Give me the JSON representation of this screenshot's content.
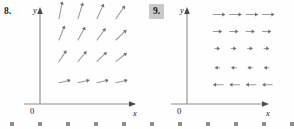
{
  "figure": {
    "caption_panels": [
      {
        "number_label": "8.",
        "highlighted": false,
        "axes": {
          "x_label": "x",
          "y_label": "y",
          "origin_label": "0"
        },
        "field_description": "Arrows point up and to the right; slope decreases with increasing x and the bottom row is horizontal.",
        "arrow_color": "#9a9a9a",
        "axis_color": "#8c8c8c"
      },
      {
        "number_label": "9.",
        "highlighted": true,
        "highlight_color": "#c9c9c9",
        "axes": {
          "x_label": "x",
          "y_label": "y",
          "origin_label": "0"
        },
        "field_description": "Horizontal arrows: pointing right in the upper rows, pointing left in the lower rows, with length shrinking toward the middle.",
        "arrow_color": "#9a9a9a",
        "axis_color": "#8c8c8c"
      }
    ],
    "bottom_markers": {
      "count": 11,
      "spacing": 28,
      "color": "#8e8e8e",
      "size": 4
    }
  },
  "chart_data": [
    {
      "type": "scatter",
      "title": "",
      "subtitle": "",
      "xlabel": "x",
      "ylabel": "y",
      "origin_label": "0",
      "grid": false,
      "legend_position": "none",
      "plot_kind": "vector-field",
      "axis_ranges": {
        "xlim": [
          0,
          5
        ],
        "ylim": [
          0,
          4.5
        ]
      },
      "annotations": [
        "8."
      ],
      "vectors": [
        {
          "x": 1,
          "y": 1,
          "dx": 0.62,
          "dy": 0.12
        },
        {
          "x": 2,
          "y": 1,
          "dx": 0.62,
          "dy": 0.12
        },
        {
          "x": 3,
          "y": 1,
          "dx": 0.62,
          "dy": 0.12
        },
        {
          "x": 4,
          "y": 1,
          "dx": 0.62,
          "dy": 0.12
        },
        {
          "x": 1,
          "y": 2,
          "dx": 0.4,
          "dy": 0.52
        },
        {
          "x": 2,
          "y": 2,
          "dx": 0.46,
          "dy": 0.48
        },
        {
          "x": 3,
          "y": 2,
          "dx": 0.52,
          "dy": 0.44
        },
        {
          "x": 4,
          "y": 2,
          "dx": 0.58,
          "dy": 0.4
        },
        {
          "x": 1,
          "y": 3,
          "dx": 0.3,
          "dy": 0.68
        },
        {
          "x": 2,
          "y": 3,
          "dx": 0.38,
          "dy": 0.62
        },
        {
          "x": 3,
          "y": 3,
          "dx": 0.46,
          "dy": 0.56
        },
        {
          "x": 4,
          "y": 3,
          "dx": 0.56,
          "dy": 0.48
        },
        {
          "x": 1,
          "y": 4,
          "dx": 0.18,
          "dy": 0.82
        },
        {
          "x": 2,
          "y": 4,
          "dx": 0.26,
          "dy": 0.76
        },
        {
          "x": 3,
          "y": 4,
          "dx": 0.36,
          "dy": 0.7
        },
        {
          "x": 4,
          "y": 4,
          "dx": 0.48,
          "dy": 0.62
        }
      ]
    },
    {
      "type": "scatter",
      "title": "",
      "subtitle": "",
      "xlabel": "x",
      "ylabel": "y",
      "origin_label": "0",
      "grid": false,
      "legend_position": "none",
      "plot_kind": "vector-field",
      "axis_ranges": {
        "xlim": [
          0,
          5
        ],
        "ylim": [
          0,
          4.5
        ]
      },
      "annotations": [
        "9."
      ],
      "vectors": [
        {
          "x": 1.6,
          "y": 4.2,
          "dx": 0.74,
          "dy": 0
        },
        {
          "x": 2.6,
          "y": 4.2,
          "dx": 0.74,
          "dy": 0
        },
        {
          "x": 3.6,
          "y": 4.2,
          "dx": 0.74,
          "dy": 0
        },
        {
          "x": 4.6,
          "y": 4.2,
          "dx": 0.74,
          "dy": 0
        },
        {
          "x": 1.6,
          "y": 3.4,
          "dx": 0.54,
          "dy": 0
        },
        {
          "x": 2.6,
          "y": 3.4,
          "dx": 0.54,
          "dy": 0
        },
        {
          "x": 3.6,
          "y": 3.4,
          "dx": 0.54,
          "dy": 0
        },
        {
          "x": 4.6,
          "y": 3.4,
          "dx": 0.54,
          "dy": 0
        },
        {
          "x": 1.7,
          "y": 2.6,
          "dx": 0.32,
          "dy": 0
        },
        {
          "x": 2.7,
          "y": 2.6,
          "dx": 0.32,
          "dy": 0
        },
        {
          "x": 3.7,
          "y": 2.6,
          "dx": 0.32,
          "dy": 0
        },
        {
          "x": 4.7,
          "y": 2.6,
          "dx": 0.32,
          "dy": 0
        },
        {
          "x": 2.0,
          "y": 1.7,
          "dx": -0.32,
          "dy": 0
        },
        {
          "x": 3.0,
          "y": 1.7,
          "dx": -0.32,
          "dy": 0
        },
        {
          "x": 4.0,
          "y": 1.7,
          "dx": -0.32,
          "dy": 0
        },
        {
          "x": 5.0,
          "y": 1.7,
          "dx": -0.32,
          "dy": 0
        },
        {
          "x": 2.2,
          "y": 0.9,
          "dx": -0.62,
          "dy": 0
        },
        {
          "x": 3.2,
          "y": 0.9,
          "dx": -0.62,
          "dy": 0
        },
        {
          "x": 4.2,
          "y": 0.9,
          "dx": -0.62,
          "dy": 0
        },
        {
          "x": 5.2,
          "y": 0.9,
          "dx": -0.62,
          "dy": 0
        }
      ]
    }
  ]
}
